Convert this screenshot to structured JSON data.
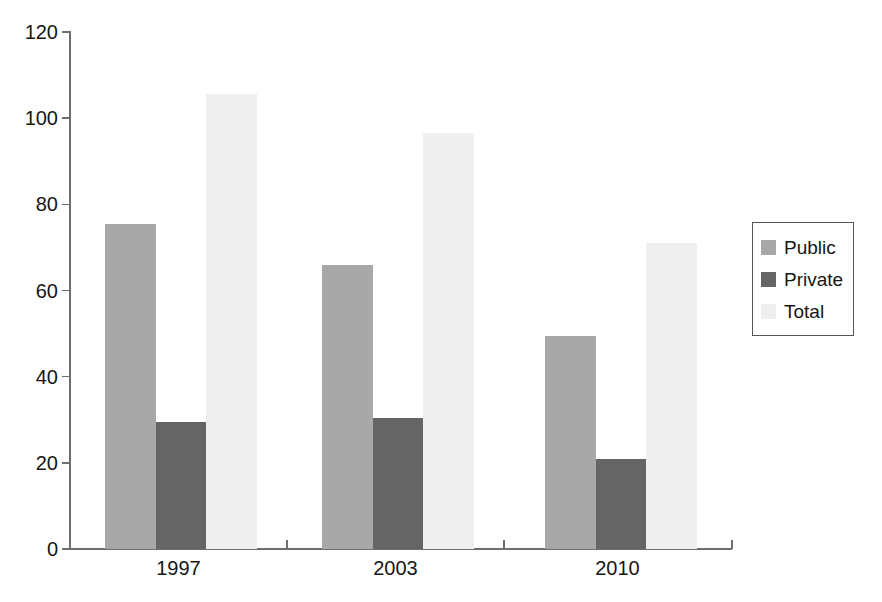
{
  "chart_data": {
    "type": "bar",
    "title": "",
    "xlabel": "",
    "ylabel": "",
    "categories": [
      "1997",
      "2003",
      "2010"
    ],
    "series": [
      {
        "name": "Public",
        "color": "#a8a8a8",
        "values": [
          75.5,
          66.0,
          49.5
        ]
      },
      {
        "name": "Private",
        "color": "#656565",
        "values": [
          29.5,
          30.5,
          21.0
        ]
      },
      {
        "name": "Total",
        "color": "#efefef",
        "values": [
          105.5,
          96.5,
          71.0
        ]
      }
    ],
    "ylim": [
      0,
      120
    ],
    "ytick_labels": [
      "0",
      "20",
      "40",
      "60",
      "80",
      "100",
      "120"
    ],
    "ytick_values": [
      0,
      20,
      40,
      60,
      80,
      100,
      120
    ],
    "grid": false,
    "legend_position": "right",
    "legend_entries": [
      "Public",
      "Private",
      "Total"
    ]
  },
  "axis": {
    "y_ticks": [
      "120",
      "100",
      "80",
      "60",
      "40",
      "20",
      "0"
    ],
    "x_labels": [
      "1997",
      "2003",
      "2010"
    ]
  },
  "legend": {
    "items": [
      {
        "label": "Public"
      },
      {
        "label": "Private"
      },
      {
        "label": "Total"
      }
    ]
  }
}
